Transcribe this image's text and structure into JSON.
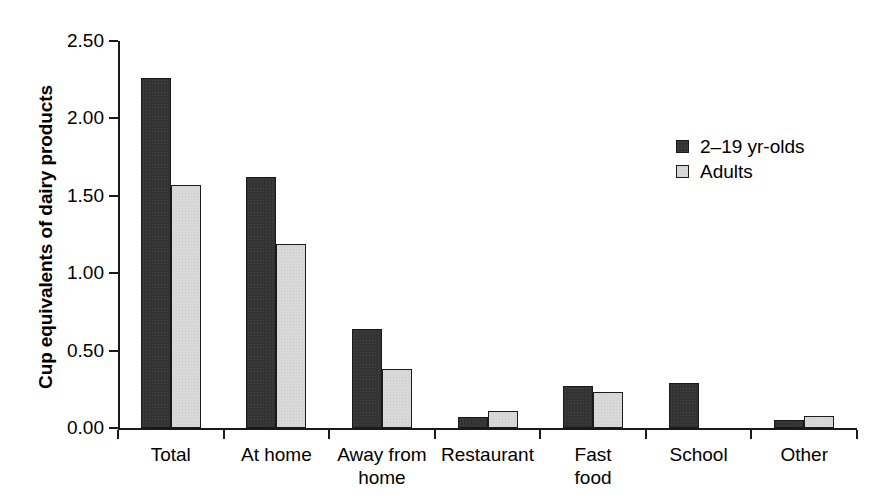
{
  "chart_data": {
    "type": "bar",
    "title": "",
    "subtitle": "",
    "xlabel": "",
    "ylabel": "Cup equivalents of dairy products",
    "categories": [
      "Total",
      "At home",
      "Away from\nhome",
      "Restaurant",
      "Fast\nfood",
      "School",
      "Other"
    ],
    "series": [
      {
        "name": "2–19 yr-olds",
        "color": "#333333",
        "values": [
          2.26,
          1.62,
          0.64,
          0.07,
          0.27,
          0.29,
          0.05
        ]
      },
      {
        "name": "Adults",
        "color": "#d9d9d9",
        "values": [
          1.57,
          1.19,
          0.38,
          0.11,
          0.23,
          null,
          0.08
        ]
      }
    ],
    "ylim": [
      0.0,
      2.5
    ],
    "ytick_values": [
      0.0,
      0.5,
      1.0,
      1.5,
      2.0,
      2.5
    ],
    "ytick_labels": [
      "0.00",
      "0.50",
      "1.00",
      "1.50",
      "2.00",
      "2.50"
    ],
    "grid": false,
    "legend_position": "upper right",
    "axis_color": "#1a1a1a",
    "background": "#ffffff"
  }
}
